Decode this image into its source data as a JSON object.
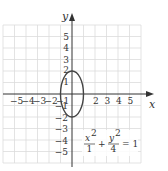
{
  "diagram": {
    "title": "",
    "equation": {
      "x_num": "x",
      "x_exp": "2",
      "x_den": "1",
      "plus": "+",
      "y_num": "y",
      "y_exp": "2",
      "y_den": "4",
      "equals": "= 1"
    },
    "axes": {
      "x_label": "x",
      "y_label": "y",
      "x_ticks_neg": [
        "−5",
        "−4",
        "−3",
        "−2",
        "−1"
      ],
      "x_ticks_pos": [
        "2",
        "3",
        "4",
        "5"
      ],
      "y_ticks_pos": [
        "5",
        "4",
        "3",
        "2",
        "1"
      ],
      "y_ticks_neg": [
        "−1",
        "−2",
        "−3",
        "−4",
        "−5"
      ]
    },
    "ellipse": {
      "center": [
        0,
        0
      ],
      "semi_axis_x": 1,
      "semi_axis_y": 2
    },
    "grid": {
      "range_x": [
        -6,
        6
      ],
      "range_y": [
        -6,
        6
      ],
      "step": 1
    },
    "colors": {
      "grid": "#dddddd",
      "axis": "#333333",
      "curve": "#444444"
    }
  }
}
